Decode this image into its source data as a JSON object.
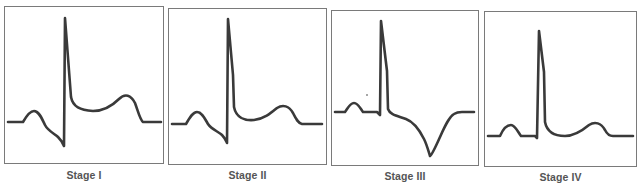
{
  "figure": {
    "stroke_color": "#3a3a3a",
    "border_color": "#7a7a7a",
    "label_color": "#555555"
  },
  "panels": [
    {
      "label": "Stage I",
      "features": "ST elevation with upright T wave, PR depression"
    },
    {
      "label": "Stage II",
      "features": "ST segment normalizes, T wave flattening begins"
    },
    {
      "label": "Stage III",
      "features": "T wave inversion"
    },
    {
      "label": "Stage IV",
      "features": "Return to normal baseline morphology"
    }
  ]
}
